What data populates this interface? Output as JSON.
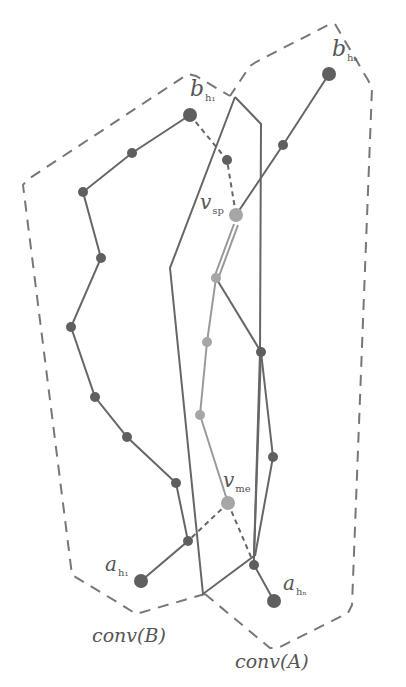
{
  "diagram": {
    "colors": {
      "dark_line": "#666666",
      "dark_node": "#5f5f5f",
      "light_node": "#a6a6a6",
      "light_line": "#9a9a9a",
      "dashed_hull": "#777777"
    },
    "labels": {
      "b_h1": {
        "main": "b",
        "sub": "h₁"
      },
      "b_hn": {
        "main": "b",
        "sub": "hₙ"
      },
      "a_h1": {
        "main": "a",
        "sub": "h₁"
      },
      "a_hn": {
        "main": "a",
        "sub": "hₙ"
      },
      "v_sp": {
        "main": "v",
        "sub": "sp"
      },
      "v_me": {
        "main": "v",
        "sub": "me"
      }
    },
    "hulls": {
      "conv_b_label": "conv(B)",
      "conv_a_label": "conv(A)"
    },
    "nodes": {
      "b_h1": [
        190,
        115
      ],
      "b_hn": [
        329,
        74
      ],
      "a_h1": [
        141,
        581
      ],
      "a_hn": [
        274,
        601
      ],
      "v_sp": [
        236,
        215
      ],
      "v_me": [
        228,
        503
      ]
    }
  }
}
